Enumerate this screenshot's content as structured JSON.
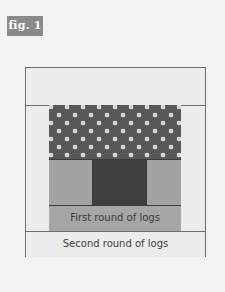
{
  "figure": {
    "label": "fig. 1"
  },
  "diagram": {
    "pieces": {
      "top_band": "",
      "polka_dot_block": "",
      "center_left": "",
      "center_square": "",
      "center_right": "",
      "first_round": "First round of logs",
      "second_round": "Second round of logs"
    },
    "colors": {
      "background": "#f3f3f3",
      "light_fabric": "#ececec",
      "polka_dot_fabric": "#585858",
      "polka_dots": "#d6d6d6",
      "mid_gray_fabric": "#a3a3a3",
      "dark_center": "#3f3f3f",
      "label_bg": "#8a8a8a"
    }
  }
}
